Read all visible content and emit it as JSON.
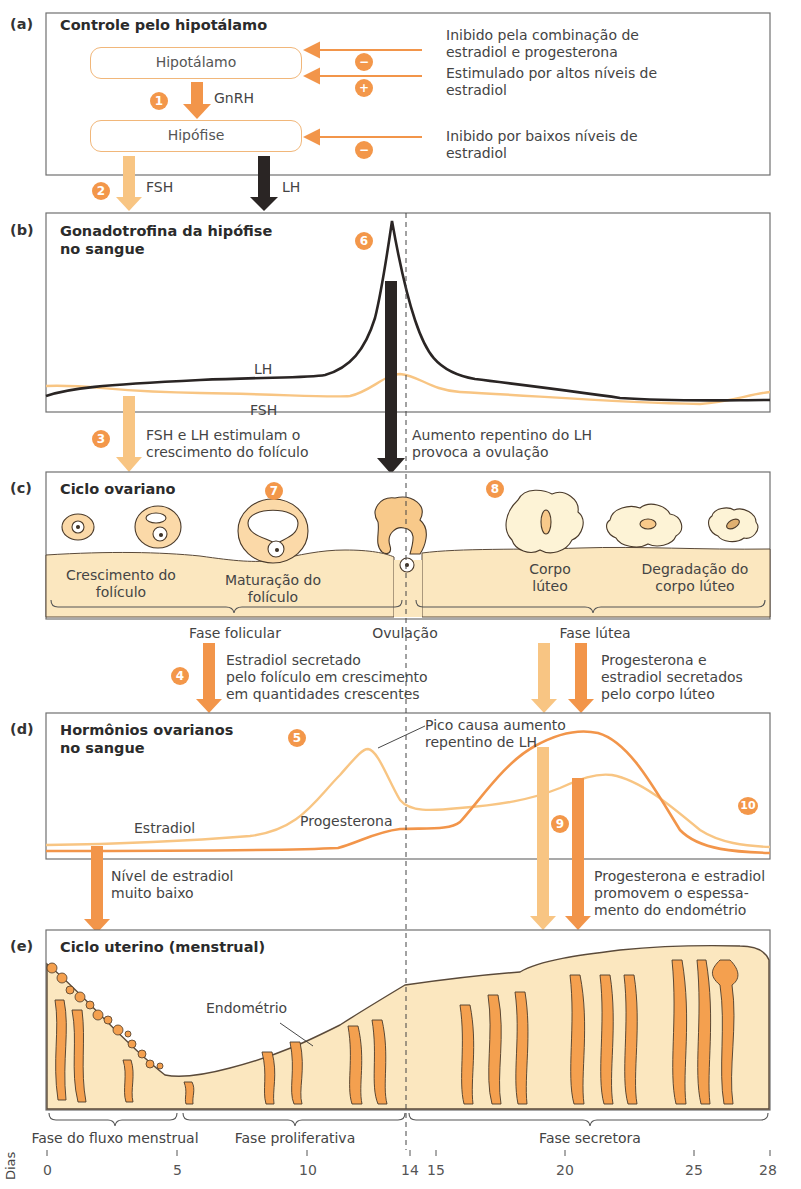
{
  "colors": {
    "orange_dark": "#f2954a",
    "orange_light": "#f8c583",
    "black_arrow": "#2a2524",
    "tissue_fill": "#fbe7bf",
    "gland_fill": "#f4a04f",
    "panel_border": "#707070"
  },
  "panel_a": {
    "letter": "(a)",
    "title": "Controle pelo hipotálamo",
    "hypothalamus_label": "Hipotálamo",
    "pituitary_label": "Hipófise",
    "gnrh_label": "GnRH",
    "step1": "1",
    "step2": "2",
    "fsh_label": "FSH",
    "lh_label": "LH",
    "feedback": [
      {
        "sign": "−",
        "text_line1": "Inibido pela combinação de",
        "text_line2": "estradiol e progesterona"
      },
      {
        "sign": "+",
        "text_line1": "Estimulado por altos níveis de",
        "text_line2": "estradiol"
      },
      {
        "sign": "−",
        "text_line1": "Inibido por baixos níveis de",
        "text_line2": "estradiol"
      }
    ]
  },
  "panel_b": {
    "letter": "(b)",
    "title_line1": "Gonadotrofina da hipófise",
    "title_line2": "no sangue",
    "step6": "6",
    "lh_curve_label": "LH",
    "fsh_curve_label": "FSH",
    "step3": "3",
    "note_left_line1": "FSH e LH estimulam o",
    "note_left_line2": "crescimento do folículo",
    "note_right_line1": "Aumento repentino do LH",
    "note_right_line2": "provoca a ovulação"
  },
  "panel_c": {
    "letter": "(c)",
    "title": "Ciclo ovariano",
    "step7": "7",
    "step8": "8",
    "growth_line1": "Crescimento do",
    "growth_line2": "folículo",
    "maturation_line1": "Maturação do",
    "maturation_line2": "folículo",
    "corpus_line1": "Corpo",
    "corpus_line2": "lúteo",
    "degradation_line1": "Degradação do",
    "degradation_line2": "corpo lúteo",
    "follicular_phase": "Fase folicular",
    "ovulation": "Ovulação",
    "luteal_phase": "Fase lútea",
    "step4": "4",
    "estradiol_note_line1": "Estradiol secretado",
    "estradiol_note_line2": "pelo folículo em crescimento",
    "estradiol_note_line3": "em quantidades crescentes",
    "luteal_note_line1": "Progesterona e",
    "luteal_note_line2": "estradiol secretados",
    "luteal_note_line3": "pelo corpo lúteo"
  },
  "panel_d": {
    "letter": "(d)",
    "title_line1": "Hormônios ovarianos",
    "title_line2": "no sangue",
    "step5": "5",
    "step9": "9",
    "step10": "10",
    "peak_note_line1": "Pico causa aumento",
    "peak_note_line2": "repentino de LH",
    "estradiol_label": "Estradiol",
    "progesterone_label": "Progesterona",
    "low_note_line1": "Nível de estradiol",
    "low_note_line2": "muito baixo",
    "thick_note_line1": "Progesterona e estradiol",
    "thick_note_line2": "promovem o espessa-",
    "thick_note_line3": "mento do endométrio"
  },
  "panel_e": {
    "letter": "(e)",
    "title": "Ciclo uterino (menstrual)",
    "endometrium_label": "Endométrio",
    "phase_menstrual": "Fase do fluxo menstrual",
    "phase_proliferative": "Fase proliferativa",
    "phase_secretory": "Fase secretora"
  },
  "axis": {
    "label": "Dias",
    "ticks": [
      "0",
      "5",
      "10",
      "14",
      "15",
      "20",
      "25",
      "28"
    ]
  }
}
